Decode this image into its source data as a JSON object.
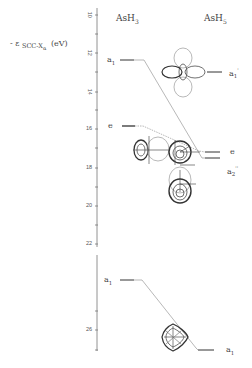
{
  "diagram": {
    "type": "mo-correlation-diagram",
    "y_axis_label": "- ε SCC-Xα (eV)",
    "y_axis_label_parts": {
      "prefix": "- ε",
      "sub": "SCC-X",
      "subsub": "α",
      "unit": "(eV)"
    },
    "y_ticks": [
      "10",
      "12",
      "14",
      "16",
      "18",
      "20",
      "22",
      "26"
    ],
    "left_column": {
      "title": "AsH3",
      "title_base": "AsH",
      "title_sub": "3",
      "levels": [
        {
          "label": "a1",
          "base": "a",
          "sub": "1",
          "energy": 10.8
        },
        {
          "label": "e",
          "base": "e",
          "sub": "",
          "energy": 14.5
        },
        {
          "label": "a1",
          "base": "a",
          "sub": "1",
          "energy": 22.4
        }
      ]
    },
    "right_column": {
      "title": "AsH5",
      "title_base": "AsH",
      "title_sub": "5",
      "levels": [
        {
          "label": "a1'",
          "base": "a",
          "sub": "1",
          "prime": "'",
          "energy": 11.4
        },
        {
          "label": "e",
          "base": "e",
          "sub": "",
          "prime": "",
          "energy": 16.0
        },
        {
          "label": "a2''",
          "base": "a",
          "sub": "2",
          "prime": "''",
          "energy": 16.3
        },
        {
          "label": "a1",
          "base": "a",
          "sub": "1",
          "prime": "",
          "energy": 26.5
        }
      ]
    },
    "correlations": [
      {
        "from": "AsH3 a1 (10.8)",
        "to": "AsH5 e/a2'' (16)"
      },
      {
        "from": "AsH3 e (14.5)",
        "to": "AsH5 e (16)"
      },
      {
        "from": "AsH3 a1 (22.4)",
        "to": "AsH5 a1 (26.5)"
      }
    ],
    "orbital_plots": [
      "a1' lobe plot (four-lobe)",
      "e orbital pair (two lobes, left)",
      "e orbital (center)",
      "a2'' orbital (vertical two-lobe)",
      "a1 orbital (diamond)"
    ]
  }
}
